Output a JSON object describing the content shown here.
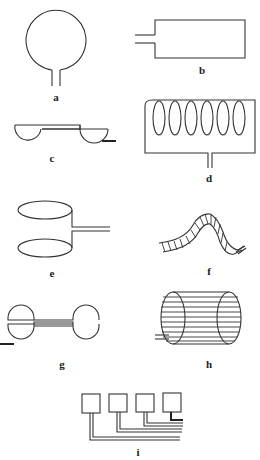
{
  "figure": {
    "panels": [
      {
        "id": "a",
        "label": "a",
        "shape": "circular loop with twin leads"
      },
      {
        "id": "b",
        "label": "b",
        "shape": "rectangular loop with twin leads"
      },
      {
        "id": "c",
        "label": "c",
        "shape": "two half-disc electrodes joined by bar"
      },
      {
        "id": "d",
        "label": "d",
        "shape": "multi-turn solenoid coil"
      },
      {
        "id": "e",
        "label": "e",
        "shape": "two stacked elliptical loops"
      },
      {
        "id": "f",
        "label": "f",
        "shape": "flexible hatched strip"
      },
      {
        "id": "g",
        "label": "g",
        "shape": "dumbbell / butterfly coil"
      },
      {
        "id": "h",
        "label": "h",
        "shape": "cylindrical birdcage coil"
      },
      {
        "id": "i",
        "label": "i",
        "shape": "phased array of four square coils"
      }
    ],
    "colors": {
      "line": "#333333",
      "background": "#ffffff"
    }
  }
}
